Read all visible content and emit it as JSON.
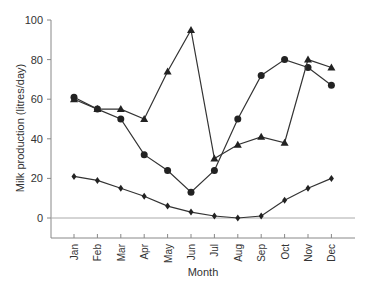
{
  "chart_data": {
    "type": "line",
    "title": "",
    "xlabel": "Month",
    "ylabel": "Milk production (litres/day)",
    "categories": [
      "Jan",
      "Feb",
      "Mar",
      "Apr",
      "May",
      "Jun",
      "Jul",
      "Aug",
      "Sep",
      "Oct",
      "Nov",
      "Dec"
    ],
    "ylim": [
      -10,
      100
    ],
    "yticks": [
      0,
      20,
      40,
      60,
      80,
      100
    ],
    "grid": false,
    "legend": null,
    "series": [
      {
        "name": "circles",
        "marker": "circle",
        "values": [
          61,
          55,
          50,
          32,
          24,
          13,
          24,
          50,
          72,
          80,
          76,
          67
        ]
      },
      {
        "name": "triangles",
        "marker": "triangle",
        "values": [
          60,
          55,
          55,
          50,
          74,
          95,
          30,
          37,
          41,
          38,
          80,
          76
        ]
      },
      {
        "name": "diamonds",
        "marker": "diamond",
        "values": [
          21,
          19,
          15,
          11,
          6,
          3,
          1,
          0,
          1,
          9,
          15,
          20
        ]
      }
    ],
    "reference_line": {
      "y": 0
    }
  },
  "colors": {
    "line": "#333333",
    "axis": "#888888",
    "text": "#333333",
    "zero_line": "#aaaaaa"
  }
}
